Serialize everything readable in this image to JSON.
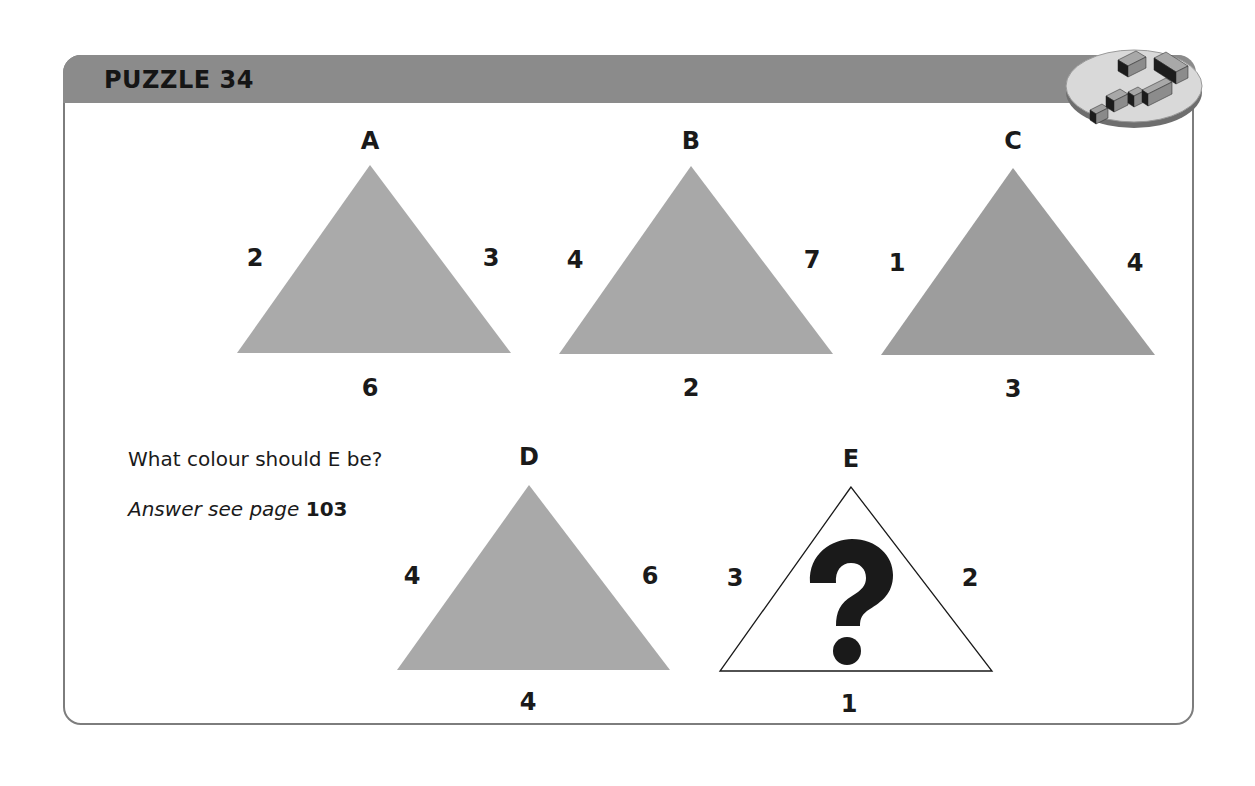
{
  "header": {
    "title": "PUZZLE 34",
    "logo_icon": "question-mark-blocks-icon"
  },
  "colors": {
    "header_band": "#8b8b8b",
    "frame_border": "#7d7d7d",
    "triangle_light_gray": "#aaaaaa",
    "triangle_dark_gray": "#9d9d9d",
    "triangle_unknown": "#ffffff"
  },
  "triangles": [
    {
      "label": "A",
      "left": "2",
      "right": "3",
      "bottom": "6",
      "fill": "#aaaaaa"
    },
    {
      "label": "B",
      "left": "4",
      "right": "7",
      "bottom": "2",
      "fill": "#a8a8a8"
    },
    {
      "label": "C",
      "left": "1",
      "right": "4",
      "bottom": "3",
      "fill": "#9d9d9d"
    },
    {
      "label": "D",
      "left": "4",
      "right": "6",
      "bottom": "4",
      "fill": "#a9a9a9"
    },
    {
      "label": "E",
      "left": "3",
      "right": "2",
      "bottom": "1",
      "fill": "#ffffff",
      "mark": "?"
    }
  ],
  "question": "What colour should E be?",
  "answer": {
    "prefix": "Answer see page",
    "page": "103"
  }
}
